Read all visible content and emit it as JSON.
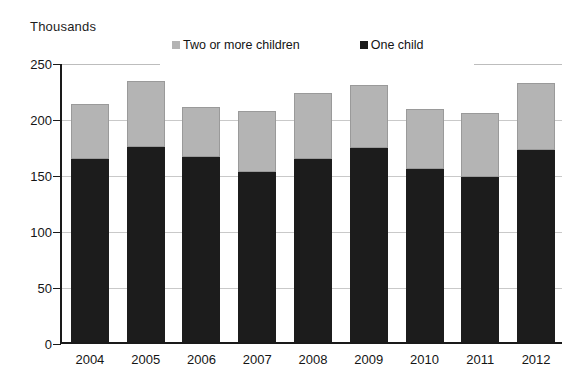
{
  "chart_data": {
    "type": "bar",
    "subtype": "stacked-bar",
    "title": "",
    "ylabel": "Thousands",
    "xlabel": "",
    "ylim": [
      0,
      250
    ],
    "yticks": [
      0,
      50,
      100,
      150,
      200,
      250
    ],
    "grid": true,
    "legend_position": "top",
    "categories": [
      "2004",
      "2005",
      "2006",
      "2007",
      "2008",
      "2009",
      "2010",
      "2011",
      "2012"
    ],
    "series": [
      {
        "name": "One child",
        "color": "#1c1c1c",
        "values": [
          165,
          176,
          167,
          154,
          165,
          175,
          156,
          149,
          173
        ]
      },
      {
        "name": "Two or more children",
        "color": "#b4b4b4",
        "values": [
          49,
          59,
          45,
          54,
          59,
          56,
          54,
          57,
          60
        ]
      }
    ],
    "totals": [
      214,
      235,
      212,
      208,
      224,
      231,
      210,
      206,
      233
    ]
  },
  "legend": {
    "items": [
      {
        "label": "Two or more children",
        "swatch": "gray"
      },
      {
        "label": "One child",
        "swatch": "black"
      }
    ]
  },
  "axis": {
    "y_title": "Thousands",
    "y_tick_labels": [
      "250",
      "200",
      "150",
      "100",
      "50",
      "0"
    ],
    "x_tick_labels": [
      "2004",
      "2005",
      "2006",
      "2007",
      "2008",
      "2009",
      "2010",
      "2011",
      "2012"
    ]
  },
  "colors": {
    "one_child": "#1c1c1c",
    "two_or_more": "#b4b4b4",
    "grid": "#c9c9c9",
    "axis": "#1a1a1a",
    "background": "#ffffff"
  }
}
